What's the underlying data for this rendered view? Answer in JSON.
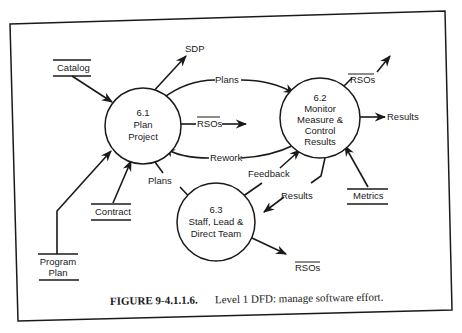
{
  "figure": {
    "caption_number": "FIGURE 9-4.1.1.6.",
    "caption_text": "Level 1 DFD: manage software effort."
  },
  "processes": [
    {
      "id": "6.1",
      "lines": [
        "6.1",
        "Plan",
        "Project"
      ]
    },
    {
      "id": "6.2",
      "lines": [
        "6.2",
        "Monitor",
        "Measure &",
        "Control",
        "Results"
      ]
    },
    {
      "id": "6.3",
      "lines": [
        "6.3",
        "Staff, Lead &",
        "Direct Team"
      ]
    }
  ],
  "stores": [
    {
      "name": "catalog",
      "lines": [
        "Catalog"
      ]
    },
    {
      "name": "contract",
      "lines": [
        "Contract"
      ]
    },
    {
      "name": "program-plan",
      "lines": [
        "Program",
        "Plan"
      ]
    },
    {
      "name": "metrics",
      "lines": [
        "Metrics"
      ]
    }
  ],
  "flows": {
    "sdp": "SDP",
    "plans_6_1_to_6_2": "Plans",
    "rsos_6_1": "RSOs",
    "rework": "Rework",
    "rsos_6_2": "RSOs",
    "results_out": "Results",
    "plans_6_1_to_6_3": "Plans",
    "feedback": "Feedback",
    "results_6_2_to_6_3": "Results",
    "rsos_6_3": "RSOs"
  },
  "colors": {
    "ink": "#1a1a1a",
    "paper": "#ffffff"
  }
}
